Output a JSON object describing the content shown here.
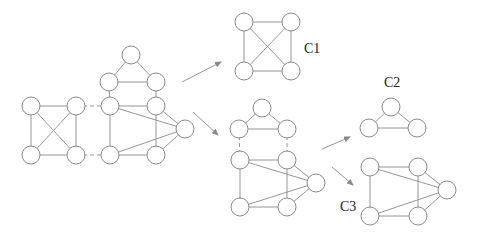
{
  "diagram": {
    "title": "",
    "node_radius": 9,
    "graphs": [
      {
        "id": "G",
        "label": "",
        "nodes": [
          {
            "id": "a",
            "x": 31,
            "y": 106
          },
          {
            "id": "b",
            "x": 76,
            "y": 106
          },
          {
            "id": "c",
            "x": 31,
            "y": 155
          },
          {
            "id": "d",
            "x": 76,
            "y": 155
          },
          {
            "id": "e",
            "x": 131,
            "y": 55
          },
          {
            "id": "f",
            "x": 109,
            "y": 82
          },
          {
            "id": "g",
            "x": 156,
            "y": 82
          },
          {
            "id": "h",
            "x": 110,
            "y": 106
          },
          {
            "id": "i",
            "x": 156,
            "y": 106
          },
          {
            "id": "j",
            "x": 185,
            "y": 129
          },
          {
            "id": "k",
            "x": 110,
            "y": 155
          },
          {
            "id": "l",
            "x": 156,
            "y": 155
          }
        ],
        "edges": [
          [
            "a",
            "b"
          ],
          [
            "a",
            "c"
          ],
          [
            "a",
            "d"
          ],
          [
            "b",
            "c"
          ],
          [
            "b",
            "d"
          ],
          [
            "c",
            "d"
          ],
          [
            "e",
            "f"
          ],
          [
            "e",
            "g"
          ],
          [
            "f",
            "g"
          ],
          [
            "f",
            "h"
          ],
          [
            "g",
            "i"
          ],
          [
            "h",
            "i"
          ],
          [
            "h",
            "k"
          ],
          [
            "h",
            "j"
          ],
          [
            "i",
            "l"
          ],
          [
            "i",
            "j"
          ],
          [
            "k",
            "l"
          ],
          [
            "k",
            "j"
          ],
          [
            "l",
            "j"
          ]
        ],
        "dashed_edges": [
          [
            "b",
            "h"
          ],
          [
            "d",
            "k"
          ]
        ]
      },
      {
        "id": "C1",
        "label": "C1",
        "label_pos": {
          "x": 304,
          "y": 42
        },
        "nodes": [
          {
            "id": "p",
            "x": 244,
            "y": 22
          },
          {
            "id": "q",
            "x": 291,
            "y": 22
          },
          {
            "id": "r",
            "x": 244,
            "y": 71
          },
          {
            "id": "s",
            "x": 291,
            "y": 71
          }
        ],
        "edges": [
          [
            "p",
            "q"
          ],
          [
            "p",
            "r"
          ],
          [
            "p",
            "s"
          ],
          [
            "q",
            "r"
          ],
          [
            "q",
            "s"
          ],
          [
            "r",
            "s"
          ]
        ],
        "dashed_edges": []
      },
      {
        "id": "M",
        "label": "",
        "nodes": [
          {
            "id": "t1",
            "x": 262,
            "y": 108
          },
          {
            "id": "t2",
            "x": 239,
            "y": 129
          },
          {
            "id": "t3",
            "x": 287,
            "y": 129
          },
          {
            "id": "m1",
            "x": 240,
            "y": 160
          },
          {
            "id": "m2",
            "x": 287,
            "y": 160
          },
          {
            "id": "m3",
            "x": 316,
            "y": 183
          },
          {
            "id": "m4",
            "x": 240,
            "y": 207
          },
          {
            "id": "m5",
            "x": 287,
            "y": 207
          }
        ],
        "edges": [
          [
            "t1",
            "t2"
          ],
          [
            "t1",
            "t3"
          ],
          [
            "t2",
            "t3"
          ],
          [
            "m1",
            "m2"
          ],
          [
            "m1",
            "m4"
          ],
          [
            "m1",
            "m3"
          ],
          [
            "m2",
            "m5"
          ],
          [
            "m2",
            "m3"
          ],
          [
            "m4",
            "m5"
          ],
          [
            "m4",
            "m3"
          ],
          [
            "m5",
            "m3"
          ]
        ],
        "dashed_edges": [
          [
            "t2",
            "m1"
          ],
          [
            "t3",
            "m2"
          ]
        ]
      },
      {
        "id": "C2",
        "label": "C2",
        "label_pos": {
          "x": 384,
          "y": 76
        },
        "nodes": [
          {
            "id": "u1",
            "x": 391,
            "y": 107
          },
          {
            "id": "u2",
            "x": 369,
            "y": 128
          },
          {
            "id": "u3",
            "x": 417,
            "y": 128
          }
        ],
        "edges": [
          [
            "u1",
            "u2"
          ],
          [
            "u1",
            "u3"
          ],
          [
            "u2",
            "u3"
          ]
        ],
        "dashed_edges": []
      },
      {
        "id": "C3",
        "label": "C3",
        "label_pos": {
          "x": 340,
          "y": 200
        },
        "nodes": [
          {
            "id": "v1",
            "x": 370,
            "y": 167
          },
          {
            "id": "v2",
            "x": 418,
            "y": 167
          },
          {
            "id": "v3",
            "x": 447,
            "y": 190
          },
          {
            "id": "v4",
            "x": 370,
            "y": 216
          },
          {
            "id": "v5",
            "x": 418,
            "y": 216
          }
        ],
        "edges": [
          [
            "v1",
            "v2"
          ],
          [
            "v1",
            "v4"
          ],
          [
            "v1",
            "v3"
          ],
          [
            "v2",
            "v5"
          ],
          [
            "v2",
            "v3"
          ],
          [
            "v4",
            "v5"
          ],
          [
            "v4",
            "v3"
          ],
          [
            "v5",
            "v3"
          ]
        ],
        "dashed_edges": []
      }
    ],
    "arrows": [
      {
        "from": {
          "x": 182,
          "y": 82
        },
        "to": {
          "x": 221,
          "y": 62
        }
      },
      {
        "from": {
          "x": 193,
          "y": 112
        },
        "to": {
          "x": 218,
          "y": 135
        }
      },
      {
        "from": {
          "x": 322,
          "y": 149
        },
        "to": {
          "x": 350,
          "y": 137
        }
      },
      {
        "from": {
          "x": 332,
          "y": 167
        },
        "to": {
          "x": 353,
          "y": 185
        }
      }
    ]
  }
}
